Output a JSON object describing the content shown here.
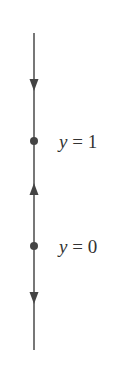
{
  "diagram": {
    "type": "phase-line",
    "line_color": "#555555",
    "equilibria": [
      {
        "variable": "y",
        "operator": "=",
        "value": "1",
        "label": "y = 1"
      },
      {
        "variable": "y",
        "operator": "=",
        "value": "0",
        "label": "y = 0"
      }
    ],
    "arrows": [
      {
        "position": "above y = 1",
        "direction": "down"
      },
      {
        "position": "between y = 0 and y = 1",
        "direction": "up"
      },
      {
        "position": "below y = 0",
        "direction": "down"
      }
    ]
  }
}
